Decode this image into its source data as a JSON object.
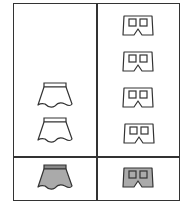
{
  "diagram": {
    "type": "pictograph-table",
    "columns": [
      {
        "name": "skirts",
        "icon": "skirt-icon",
        "tally_count": 2,
        "key_count": 1
      },
      {
        "name": "shorts",
        "icon": "shorts-icon",
        "tally_count": 4,
        "key_count": 1
      }
    ],
    "rows": [
      "tally",
      "key"
    ],
    "colors": {
      "outline": "#333333",
      "fill_outline_icon": "#ffffff",
      "fill_key_icon": "#aaaaaa",
      "waistband_key": "#888888"
    }
  }
}
